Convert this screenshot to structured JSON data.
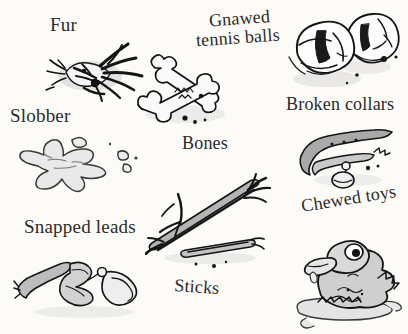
{
  "page": {
    "background_color": "#fcfbf7",
    "ink_color": "#232323",
    "width": 408,
    "height": 334
  },
  "labels": {
    "fur": "Fur",
    "gnawed_line1": "Gnawed",
    "gnawed_line2": "tennis balls",
    "broken_collars": "Broken collars",
    "slobber": "Slobber",
    "bones": "Bones",
    "snapped_leads": "Snapped leads",
    "chewed_toys": "Chewed toys",
    "sticks": "Sticks"
  },
  "figures": [
    {
      "name": "fur-tuft",
      "label_key": "fur",
      "description": "spiky black tuft of fur with grey smudge"
    },
    {
      "name": "tennis-balls",
      "label_key": "gnawed_line1",
      "description": "two chewed tennis balls with torn seams"
    },
    {
      "name": "crossed-bones",
      "label_key": "bones",
      "description": "two crossed gnawed bones with crumbs"
    },
    {
      "name": "broken-collar",
      "label_key": "broken_collars",
      "description": "snapped grey collar with hanging round name tag"
    },
    {
      "name": "slobber-splat",
      "label_key": "slobber",
      "description": "grey drool splat with flying droplets"
    },
    {
      "name": "snapped-lead",
      "label_key": "snapped_leads",
      "description": "torn dog lead strap with metal clip and loop"
    },
    {
      "name": "sticks",
      "label_key": "sticks",
      "description": "two splintered chewed sticks crossed"
    },
    {
      "name": "chewed-duck-toy",
      "label_key": "chewed_toys",
      "description": "mangled rubber duck toy sitting in a puddle"
    }
  ]
}
